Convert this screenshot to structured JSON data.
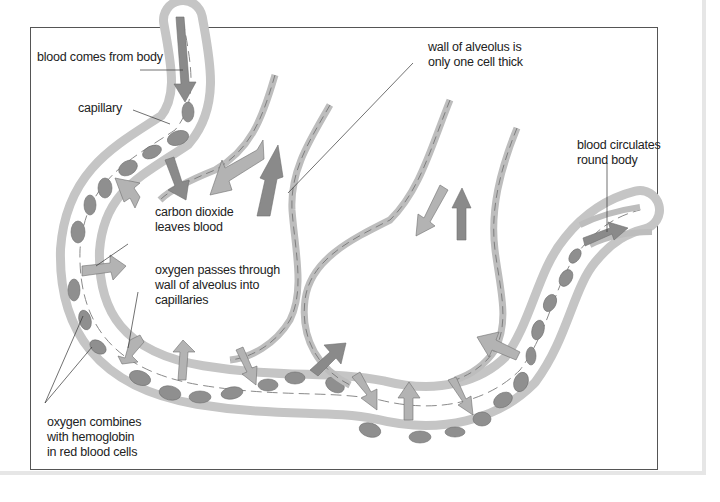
{
  "diagram": {
    "labels": {
      "blood_from_body": "blood comes from body",
      "capillary": "capillary",
      "wall_line1": "wall of alveolus is",
      "wall_line2": "only one cell thick",
      "co2_line1": "carbon dioxide",
      "co2_line2": "leaves blood",
      "oxygen_line1": "oxygen passes through",
      "oxygen_line2": "wall of alveolus into",
      "oxygen_line3": "capillaries",
      "circulates_line1": "blood circulates",
      "circulates_line2": "round body",
      "hemoglobin_line1": "oxygen combines",
      "hemoglobin_line2": "with hemoglobin",
      "hemoglobin_line3": "in red blood cells"
    },
    "colors": {
      "cell_wall": "#c9c9c9",
      "cell_wall_stroke": "#888888",
      "red_blood_cell": "#8f8f8f",
      "arrow_dark": "#8a8a8a",
      "arrow_light": "#b3b3b3",
      "frame": "#555555"
    }
  }
}
